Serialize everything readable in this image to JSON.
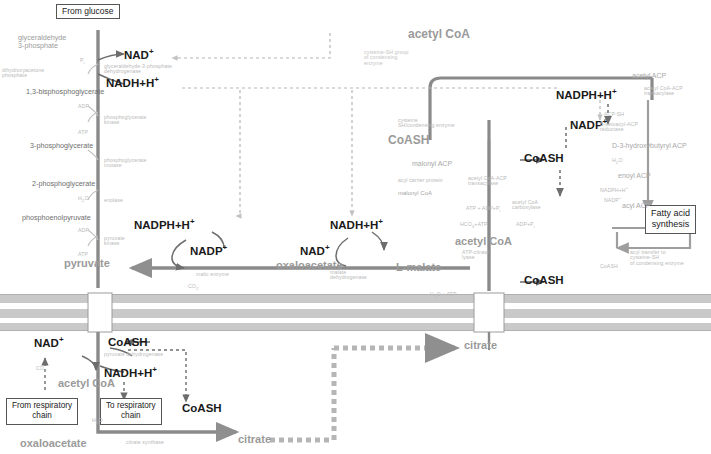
{
  "diagram": {
    "colors": {
      "membrane": "#bcbcbc",
      "arrow_dark": "#6d6d6d",
      "arrow_grey": "#9a9a9a",
      "faint": "#c4c4c4",
      "text_bold": "#1a1a1a",
      "text_grey": "#9a9a9a"
    },
    "boxes": [
      {
        "id": "from-glucose",
        "label": "From glucose"
      },
      {
        "id": "from-respiratory-chain",
        "label": "From respiratory\nchain"
      },
      {
        "id": "to-respiratory-chain",
        "label": "To respiratory\nchain"
      },
      {
        "id": "fatty-acid-synthesis",
        "label": "Fatty acid\nsynthesis"
      }
    ],
    "bold_labels": [
      {
        "id": "nad-plus-top",
        "text": "NAD"
      },
      {
        "id": "nadh-h-top",
        "text": "NADH+H"
      },
      {
        "id": "nadph-h-right",
        "text": "NADPH+H"
      },
      {
        "id": "nadp-plus-right",
        "text": "NADP"
      },
      {
        "id": "coash-mid-right",
        "text": "CoASH"
      },
      {
        "id": "coash-lower-right",
        "text": "CoASH"
      },
      {
        "id": "nadph-h-mid",
        "text": "NADPH+H"
      },
      {
        "id": "nadp-plus-mid",
        "text": "NADP"
      },
      {
        "id": "nadh-h-mid",
        "text": "NADH+H"
      },
      {
        "id": "nad-plus-mid",
        "text": "NAD"
      },
      {
        "id": "nad-plus-bottom",
        "text": "NAD"
      },
      {
        "id": "coash-bottom",
        "text": "CoASH"
      },
      {
        "id": "nadh-h-bottom",
        "text": "NADH+H"
      },
      {
        "id": "coash-bottom-2",
        "text": "CoASH"
      }
    ],
    "grey_labels": [
      {
        "id": "acetyl-coa-top",
        "text": "acetyl CoA"
      },
      {
        "id": "coash-top-grey",
        "text": "CoASH"
      },
      {
        "id": "malonyl-acp",
        "text": "malonyl ACP"
      },
      {
        "id": "acetyl-acp",
        "text": "acetyl ACP"
      },
      {
        "id": "acetoacetyl-acp",
        "text": "acetoacetyl ACP"
      },
      {
        "id": "d-3-hydroxybutyryl-acp",
        "text": "D-3-hydroxybutyryl ACP"
      },
      {
        "id": "enoyl-acp",
        "text": "enoyl ACP"
      },
      {
        "id": "acyl-acp",
        "text": "acyl ACP"
      },
      {
        "id": "malonyl-coa",
        "text": "malonyl CoA"
      },
      {
        "id": "acetyl-coa-mid",
        "text": "acetyl CoA"
      },
      {
        "id": "pyruvate",
        "text": "pyruvate"
      },
      {
        "id": "oxaloacetate-mid",
        "text": "oxaloacetate"
      },
      {
        "id": "malate",
        "text": "malate"
      },
      {
        "id": "l-malate",
        "text": "L-malate"
      },
      {
        "id": "citrate-mid",
        "text": "citrate"
      },
      {
        "id": "acetyl-coa-bottom",
        "text": "acetyl CoA"
      },
      {
        "id": "oxaloacetate-bottom",
        "text": "oxaloacetate"
      },
      {
        "id": "citrate-bottom",
        "text": "citrate"
      }
    ],
    "glycolysis_labels": [
      {
        "id": "g3p",
        "text": "glyceraldehyde\n3-phosphate"
      },
      {
        "id": "dhap",
        "text": "dihydroxyacetone\nphosphate"
      },
      {
        "id": "bpg",
        "text": "1,3-bisphosphoglycerate"
      },
      {
        "id": "3pg",
        "text": "3-phosphoglycerate"
      },
      {
        "id": "2pg",
        "text": "2-phosphoglycerate"
      },
      {
        "id": "pep",
        "text": "phosphoenolpyruvate"
      }
    ],
    "enzyme_labels": [
      {
        "id": "gapdh",
        "text": "glyceraldehyde-3-phosphate\ndehydrogenase"
      },
      {
        "id": "pgk",
        "text": "phosphoglycerate\nkinase"
      },
      {
        "id": "pgm",
        "text": "phosphoglycerate\nmutase"
      },
      {
        "id": "enolase",
        "text": "enolase"
      },
      {
        "id": "pk",
        "text": "pyruvate\nkinase"
      },
      {
        "id": "malic-enzyme",
        "text": "malic enzyme"
      },
      {
        "id": "malate-dehydrogenase",
        "text": "malate\ndehydrogenase"
      },
      {
        "id": "pyruvate-dehydrogenase",
        "text": "pyruvate dehydrogenase"
      },
      {
        "id": "citrate-synthase",
        "text": "citrate synthase"
      },
      {
        "id": "atp-citrate-lyase",
        "text": "ATP-citrate lyase"
      },
      {
        "id": "acetyl-coa-carboxylase",
        "text": "acetyl CoA\ncarboxylase"
      },
      {
        "id": "acp-malonyl-transferase",
        "text": "malonyl CoA-ACP\ntransacylase"
      },
      {
        "id": "acp-acetyl-transferase",
        "text": "acetyl CoA-ACP\ntransacylase"
      },
      {
        "id": "condensing-enzyme",
        "text": "cysteine-SH group\nof condensing\nenzyme"
      },
      {
        "id": "beta-ketoacyl-reductase",
        "text": "B-ketoacyl-ACP\nreductase"
      },
      {
        "id": "dehydratase",
        "text": "B-hydroxyacyl-ACP\ndehydratase"
      },
      {
        "id": "enoyl-reductase",
        "text": "enoyl-ACP\nreductase"
      },
      {
        "id": "palmitoyl-thioesterase",
        "text": "acyl transfer to\ncysteine-SH\nof condensing enzyme"
      }
    ],
    "cofactor_labels": [
      {
        "id": "pi-1",
        "text": "Pi"
      },
      {
        "id": "adp-1",
        "text": "ADP"
      },
      {
        "id": "atp-1",
        "text": "ATP"
      },
      {
        "id": "h2o-1",
        "text": "H2O"
      },
      {
        "id": "adp-2",
        "text": "ADP"
      },
      {
        "id": "atp-2",
        "text": "ATP"
      },
      {
        "id": "co2-1",
        "text": "CO2"
      },
      {
        "id": "co2-2",
        "text": "CO2"
      },
      {
        "id": "atp-adp-pi",
        "text": "ATP + ADP+Pi"
      },
      {
        "id": "hco3-atp",
        "text": "HCO3 + ATP"
      },
      {
        "id": "adp-pi-2",
        "text": "ADP+Pi"
      },
      {
        "id": "h2o-atp",
        "text": "H2O + ATP"
      },
      {
        "id": "nadph-h-faint",
        "text": "NADPH+H"
      },
      {
        "id": "nadp-faint",
        "text": "NADP"
      },
      {
        "id": "h2o-faint",
        "text": "H2O"
      },
      {
        "id": "coash-faint",
        "text": "CoASH"
      },
      {
        "id": "acp-sh",
        "text": "ACP-SH"
      },
      {
        "id": "co2-3",
        "text": "CO2"
      }
    ]
  }
}
